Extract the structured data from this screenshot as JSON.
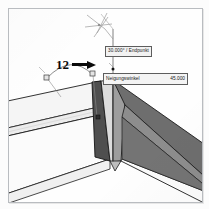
{
  "scene": {
    "title": "CAD 3D-Ansicht Gehrungsschnitt",
    "background_color": "#fefefe",
    "frame_color": "#b9bcc0"
  },
  "callout": {
    "number": "12",
    "arrow_icon": "right-arrow-icon",
    "arrow_direction": "right"
  },
  "snap_tooltip": {
    "text": "30.000° / Endpunkt",
    "angle": "30.000°",
    "snap_type": "Endpunkt",
    "separator": "/",
    "bg_color": "#f2f2f2",
    "border_color": "#5d5d5d"
  },
  "angle_box": {
    "label": "Neigungswinkel",
    "value": "45.000",
    "bg_color": "#f4f4f4",
    "border_color": "#5d5d5d"
  },
  "snap_marker": {
    "icon": "crosshair-snap-icon",
    "description": "Fadenkreuz Fangpunkt"
  },
  "geometry": {
    "left_beam_top_color": "#f4f4f4",
    "left_beam_side_color": "#ededed",
    "left_beam_front_color": "#fbfbfb",
    "miter_face_color": "#565656",
    "center_wedge_light_color": "#d8d8d8",
    "center_wedge_mid_color": "#9a9a9a",
    "right_beam_top_color": "#6e6e6e",
    "right_beam_side_color": "#8d8d8d",
    "right_beam_front_color": "#fdfdfd",
    "edge_color": "#1c1c1c",
    "helper_line_color": "#7a7a7a"
  },
  "arc_dimension": {
    "icon": "angle-arc-icon",
    "handle_icon": "grip-square-icon"
  }
}
